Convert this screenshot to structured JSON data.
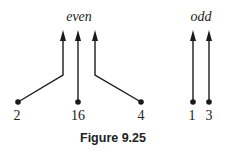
{
  "groups": {
    "even": "even",
    "odd": "odd"
  },
  "nodes": [
    {
      "label": "2",
      "group": "even"
    },
    {
      "label": "16",
      "group": "even"
    },
    {
      "label": "4",
      "group": "even"
    },
    {
      "label": "1",
      "group": "odd"
    },
    {
      "label": "3",
      "group": "odd"
    }
  ],
  "caption": "Figure 9.25",
  "colors": {
    "stroke": "#1a1a1a"
  }
}
